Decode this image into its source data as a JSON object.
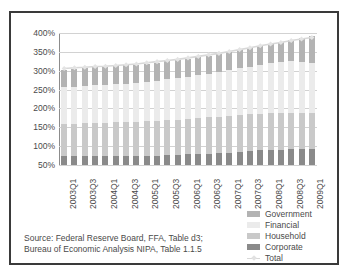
{
  "chart_data": {
    "type": "bar",
    "title": "",
    "subtitle": "",
    "xlabel": "",
    "ylabel": "",
    "ylim": [
      50,
      400
    ],
    "yticks": [
      50,
      100,
      150,
      200,
      250,
      300,
      350,
      400
    ],
    "ytick_labels": [
      "50%",
      "100%",
      "150%",
      "200%",
      "250%",
      "300%",
      "350%",
      "400%"
    ],
    "grid": true,
    "stacked": true,
    "legend_position": "bottom-right",
    "x": [
      "2003Q1",
      "2003Q2",
      "2003Q3",
      "2003Q4",
      "2004Q1",
      "2004Q2",
      "2004Q3",
      "2004Q4",
      "2005Q1",
      "2005Q2",
      "2005Q3",
      "2005Q4",
      "2006Q1",
      "2006Q2",
      "2006Q3",
      "2006Q4",
      "2007Q1",
      "2007Q2",
      "2007Q3",
      "2007Q4",
      "2008Q1",
      "2008Q2",
      "2008Q3",
      "2008Q4",
      "2009Q1"
    ],
    "xtick_labels": [
      "2003Q1",
      "2003Q3",
      "2004Q1",
      "2004Q3",
      "2005Q1",
      "2005Q3",
      "2006Q1",
      "2006Q3",
      "2007Q1",
      "2007Q3",
      "2008Q1",
      "2008Q3",
      "2009Q1"
    ],
    "categories": [
      "2003Q1",
      "2003Q2",
      "2003Q3",
      "2003Q4",
      "2004Q1",
      "2004Q2",
      "2004Q3",
      "2004Q4",
      "2005Q1",
      "2005Q2",
      "2005Q3",
      "2005Q4",
      "2006Q1",
      "2006Q2",
      "2006Q3",
      "2006Q4",
      "2007Q1",
      "2007Q2",
      "2007Q3",
      "2007Q4",
      "2008Q1",
      "2008Q2",
      "2008Q3",
      "2008Q4",
      "2009Q1"
    ],
    "series": [
      {
        "name": "Corporate",
        "color": "#8a8a8a",
        "values": [
          74,
          74,
          74,
          74,
          74,
          74,
          74,
          74,
          75,
          75,
          76,
          77,
          78,
          79,
          80,
          81,
          83,
          85,
          87,
          89,
          90,
          91,
          92,
          93,
          93
        ]
      },
      {
        "name": "Household",
        "color": "#c9c9c9",
        "values": [
          85,
          86,
          87,
          88,
          88,
          89,
          90,
          90,
          91,
          92,
          93,
          93,
          94,
          95,
          96,
          97,
          97,
          97,
          97,
          97,
          97,
          96,
          96,
          96,
          96
        ]
      },
      {
        "name": "Financial",
        "color": "#ebebeb",
        "values": [
          97,
          98,
          98,
          99,
          100,
          101,
          102,
          103,
          105,
          106,
          108,
          110,
          112,
          114,
          116,
          118,
          121,
          124,
          127,
          130,
          133,
          136,
          139,
          135,
          132
        ]
      },
      {
        "name": "Government",
        "color": "#b3b3b3",
        "values": [
          47,
          47,
          47,
          48,
          48,
          48,
          48,
          48,
          48,
          48,
          48,
          48,
          48,
          48,
          48,
          48,
          48,
          48,
          48,
          49,
          50,
          52,
          55,
          62,
          70
        ]
      }
    ],
    "total_line": {
      "name": "Total",
      "color": "#d8d8d8",
      "values": [
        306,
        308,
        309,
        311,
        312,
        314,
        316,
        318,
        321,
        324,
        327,
        330,
        334,
        338,
        342,
        346,
        351,
        356,
        361,
        366,
        371,
        375,
        380,
        384,
        388
      ]
    }
  },
  "legend": {
    "items": [
      {
        "label": "Government",
        "color": "#b3b3b3",
        "type": "swatch"
      },
      {
        "label": "Financial",
        "color": "#ebebeb",
        "type": "swatch"
      },
      {
        "label": "Household",
        "color": "#c9c9c9",
        "type": "swatch"
      },
      {
        "label": "Corporate",
        "color": "#8a8a8a",
        "type": "swatch"
      },
      {
        "label": "Total",
        "color": "#d8d8d8",
        "type": "line"
      }
    ]
  },
  "source": {
    "line1": "Source: Federal Reserve Board, FFA, Table d3;",
    "line2": "Bureau of Economic Analysis NIPA, Table 1.1.5"
  }
}
